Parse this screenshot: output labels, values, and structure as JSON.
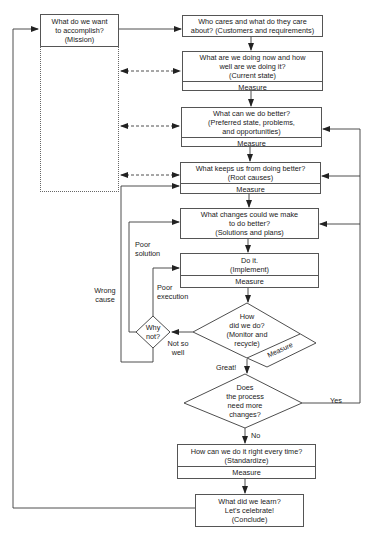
{
  "diagram": {
    "type": "flowchart",
    "boxes": {
      "mission": {
        "text": "What do we want\nto accomplish?\n(Mission)"
      },
      "customers": {
        "text": "Who cares and what do they care\nabout? (Customers and requirements)"
      },
      "current_state": {
        "text": "What are we doing now and how\nwell are we doing it?\n(Current state)",
        "measure": "Measure"
      },
      "preferred_state": {
        "text": "What can we do better?\n(Preferred state, problems,\nand opportunities)",
        "measure": "Measure"
      },
      "root_causes": {
        "text": "What keeps us from doing better?\n(Root causes)",
        "measure": "Measure"
      },
      "solutions": {
        "text": "What changes could we make\nto do better?\n(Solutions and plans)"
      },
      "implement": {
        "text": "Do it.\n(Implement)",
        "measure": "Measure"
      },
      "standardize": {
        "text": "How can we do it right every time?\n(Standardize)",
        "measure": "Measure"
      },
      "conclude": {
        "text": "What did we learn?\nLet's celebrate!\n(Conclude)"
      }
    },
    "decisions": {
      "monitor": {
        "text": "How\ndid we do?\n(Monitor and\nrecycle)",
        "measure": "Measure"
      },
      "why_not": {
        "text": "Why\nnot?"
      },
      "more_changes": {
        "text": "Does\nthe process\nneed more\nchanges?"
      }
    },
    "edge_labels": {
      "poor_solution": "Poor\nsolution",
      "poor_execution": "Poor\nexecution",
      "wrong_cause": "Wrong\ncause",
      "not_so_well": "Not so\nwell",
      "great": "Great!",
      "yes": "Yes",
      "no": "No"
    },
    "colors": {
      "line": "#3a3a3a",
      "border": "#555555",
      "background": "#ffffff"
    }
  }
}
